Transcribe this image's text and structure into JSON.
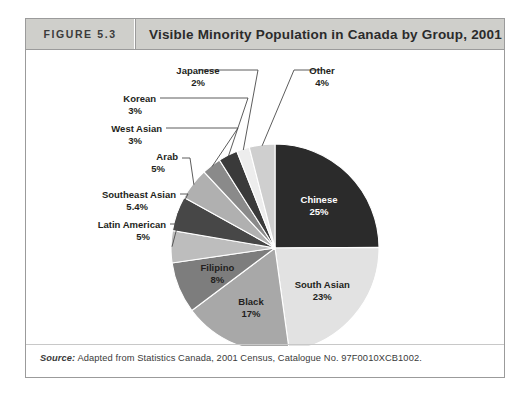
{
  "figure": {
    "number_label": "FIGURE 5.3",
    "title": "Visible Minority Population in Canada by Group, 2001",
    "source_prefix": "Source:",
    "source_text": " Adapted from Statistics Canada, 2001 Census, Catalogue No. 97F0010XCB1002."
  },
  "chart_data": {
    "type": "pie",
    "title": "Visible Minority Population in Canada by Group, 2001",
    "xlabel": "",
    "ylabel": "",
    "units": "percent",
    "start_angle_deg": 0,
    "direction": "clockwise",
    "legend_position": "none",
    "grid": false,
    "categories": [
      "Chinese",
      "South Asian",
      "Black",
      "Filipino",
      "Latin American",
      "Southeast Asian",
      "Arab",
      "West Asian",
      "Korean",
      "Japanese",
      "Other"
    ],
    "values": [
      25,
      23,
      17,
      8,
      5,
      5.4,
      5,
      3,
      3,
      2,
      4
    ],
    "slices": [
      {
        "label": "Chinese",
        "value": 25,
        "value_label": "25%",
        "color": "#2b2b2b",
        "label_placement": "inside",
        "text_tone": "on-dark"
      },
      {
        "label": "South Asian",
        "value": 23,
        "value_label": "23%",
        "color": "#e2e2e2",
        "label_placement": "inside",
        "text_tone": "on-light"
      },
      {
        "label": "Black",
        "value": 17,
        "value_label": "17%",
        "color": "#a8a8a8",
        "label_placement": "inside",
        "text_tone": "on-light"
      },
      {
        "label": "Filipino",
        "value": 8,
        "value_label": "8%",
        "color": "#7d7d7d",
        "label_placement": "inside",
        "text_tone": "on-light"
      },
      {
        "label": "Latin American",
        "value": 5,
        "value_label": "5%",
        "color": "#bdbdbd",
        "label_placement": "callout",
        "text_tone": "on-light"
      },
      {
        "label": "Southeast Asian",
        "value": 5.4,
        "value_label": "5.4%",
        "color": "#474747",
        "label_placement": "callout",
        "text_tone": "on-light"
      },
      {
        "label": "Arab",
        "value": 5,
        "value_label": "5%",
        "color": "#b0b0b0",
        "label_placement": "callout",
        "text_tone": "on-light"
      },
      {
        "label": "West Asian",
        "value": 3,
        "value_label": "3%",
        "color": "#8a8a8a",
        "label_placement": "callout",
        "text_tone": "on-light"
      },
      {
        "label": "Korean",
        "value": 3,
        "value_label": "3%",
        "color": "#3a3a3a",
        "label_placement": "callout",
        "text_tone": "on-light"
      },
      {
        "label": "Japanese",
        "value": 2,
        "value_label": "2%",
        "color": "#ededed",
        "label_placement": "callout",
        "text_tone": "on-light"
      },
      {
        "label": "Other",
        "value": 4,
        "value_label": "4%",
        "color": "#cfcfcf",
        "label_placement": "callout",
        "text_tone": "on-light"
      }
    ],
    "callout_label_positions": [
      {
        "label": "Latin American",
        "x": 140,
        "y": 178,
        "anchor": "end",
        "value_x": 124,
        "value_y": 190,
        "elbow_x": 152,
        "elbow_y": 174
      },
      {
        "label": "Southeast Asian",
        "x": 150,
        "y": 148,
        "anchor": "end",
        "value_x": 122,
        "value_y": 160,
        "elbow_x": 162,
        "elbow_y": 144
      },
      {
        "label": "Arab",
        "x": 152,
        "y": 110,
        "anchor": "end",
        "value_x": 139,
        "value_y": 122,
        "elbow_x": 164,
        "elbow_y": 108
      },
      {
        "label": "West Asian",
        "x": 136,
        "y": 82,
        "anchor": "end",
        "value_x": 116,
        "value_y": 94,
        "elbow_x": 212,
        "elbow_y": 78
      },
      {
        "label": "Korean",
        "x": 130,
        "y": 52,
        "anchor": "end",
        "value_x": 116,
        "value_y": 64,
        "elbow_x": 222,
        "elbow_y": 48
      },
      {
        "label": "Japanese",
        "x": 172,
        "y": 24,
        "anchor": "middle",
        "value_x": 172,
        "value_y": 36,
        "elbow_x": 232,
        "elbow_y": 20
      },
      {
        "label": "Other",
        "x": 296,
        "y": 24,
        "anchor": "middle",
        "value_x": 296,
        "value_y": 36,
        "elbow_x": 268,
        "elbow_y": 20
      }
    ]
  }
}
